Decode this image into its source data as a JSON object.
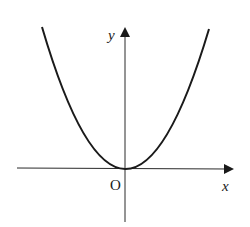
{
  "figure": {
    "type": "coordinate-graph",
    "curve": "parabola opening upward with vertex at origin",
    "labels": {
      "y_axis": "y",
      "x_axis": "x",
      "origin": "O"
    },
    "colors": {
      "stroke": "#1a1a1a",
      "background": "#ffffff"
    }
  }
}
